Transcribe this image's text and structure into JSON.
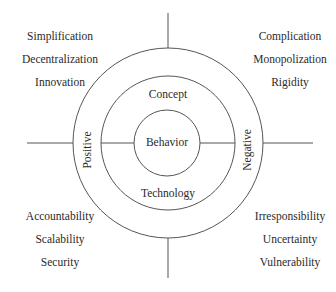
{
  "diagram": {
    "center": {
      "label": "Behavior"
    },
    "ring_middle": {
      "top_label": "Concept",
      "bottom_label": "Technology"
    },
    "ring_outer": {
      "left_label": "Positive",
      "right_label": "Negative"
    },
    "quadrants": {
      "top_left": {
        "items": [
          "Simplification",
          "Decentralization",
          "Innovation"
        ]
      },
      "top_right": {
        "items": [
          "Complication",
          "Monopolization",
          "Rigidity"
        ]
      },
      "bottom_left": {
        "items": [
          "Accountability",
          "Scalability",
          "Security"
        ]
      },
      "bottom_right": {
        "items": [
          "Irresponsibility",
          "Uncertainty",
          "Vulnerability"
        ]
      }
    },
    "stroke_color": "#555555",
    "text_color": "#2a2a2a"
  }
}
